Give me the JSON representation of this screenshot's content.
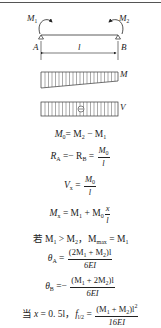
{
  "diagram": {
    "beam": {
      "left_moment": "M",
      "left_moment_sub": "1",
      "right_moment": "M",
      "right_moment_sub": "2",
      "left_support": "A",
      "right_support": "B",
      "span": "l"
    },
    "moment_diagram_label": "M",
    "shear_diagram_label": "V",
    "shear_sign": "⊖"
  },
  "equations": {
    "m0": {
      "lhs": "M",
      "lhs_sub": "0",
      "rhs": "= M",
      "rhs_sub1": "2",
      "mid": " − M",
      "rhs_sub2": "1"
    },
    "reactions": {
      "a": "R",
      "a_sub": "A",
      "mid": " =− R",
      "b_sub": "B",
      "eq": " = ",
      "num": "M",
      "num_sub": "0",
      "den": "l"
    },
    "shear": {
      "v": "V",
      "v_sub": "x",
      "eq": " = ",
      "num": "M",
      "num_sub": "0",
      "den": "l"
    },
    "moment": {
      "m": "M",
      "m_sub": "x",
      "eq": " = M",
      "sub1": "1",
      "plus": " + M",
      "sub0": "0",
      "num": "x",
      "den": "l"
    },
    "max": {
      "prefix": "若 M",
      "sub1": "1",
      "gt": " > M",
      "sub2": "2",
      "sep": "，M",
      "max_sub": "max",
      "eq": " = M",
      "sub3": "1"
    },
    "theta_a": {
      "t": "θ",
      "t_sub": "A",
      "eq": " = ",
      "num": "(2M",
      "num_sub1": "1",
      "num_mid": " + M",
      "num_sub2": "2",
      "num_end": ")l",
      "den": "6EI"
    },
    "theta_b": {
      "t": "θ",
      "t_sub": "B",
      "eq": " =− ",
      "num": "(M",
      "num_sub1": "1",
      "num_mid": " + 2M",
      "num_sub2": "2",
      "num_end": ")l",
      "den": "6EI"
    },
    "deflection": {
      "prefix": "当 ",
      "x": "x",
      "mid": " = 0. 5l，",
      "f": "f",
      "f_sub": "l/2",
      "eq": " = ",
      "num": "(M",
      "num_sub1": "1",
      "num_mid": " + M",
      "num_sub2": "2",
      "num_end": ")l",
      "num_sup": "2",
      "den": "16EI"
    }
  }
}
